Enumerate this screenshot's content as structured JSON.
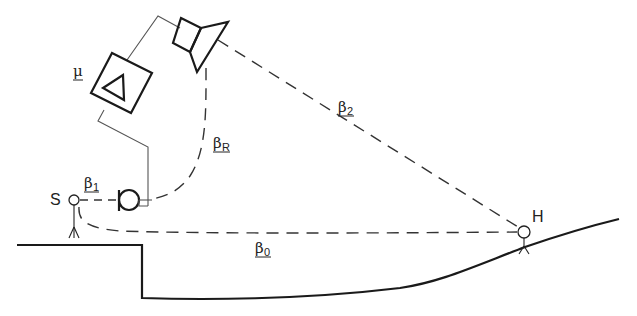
{
  "diagram": {
    "labels": {
      "amplifier_gain": "μ",
      "source": "S",
      "listener": "H",
      "beta_1": {
        "symbol": "β",
        "subscript": "1"
      },
      "beta_0": {
        "symbol": "β",
        "subscript": "0"
      },
      "beta_2": {
        "symbol": "β",
        "subscript": "2"
      },
      "beta_R": {
        "symbol": "β",
        "subscript": "R"
      }
    },
    "components": [
      {
        "id": "source",
        "label": "S",
        "type": "talker"
      },
      {
        "id": "microphone",
        "type": "microphone"
      },
      {
        "id": "amplifier",
        "label": "μ",
        "type": "amplifier"
      },
      {
        "id": "loudspeaker",
        "type": "loudspeaker"
      },
      {
        "id": "listener",
        "label": "H",
        "type": "listener"
      }
    ],
    "paths": [
      {
        "id": "beta_1",
        "from": "source",
        "to": "microphone",
        "style": "dashed"
      },
      {
        "id": "beta_0",
        "from": "source",
        "to": "listener",
        "style": "dashed"
      },
      {
        "id": "beta_2",
        "from": "loudspeaker",
        "to": "listener",
        "style": "dashed"
      },
      {
        "id": "beta_R",
        "from": "loudspeaker",
        "to": "microphone",
        "style": "dashed"
      }
    ],
    "colors": {
      "line": "#1a1a1a",
      "wire": "#555555",
      "background": "#ffffff"
    }
  }
}
